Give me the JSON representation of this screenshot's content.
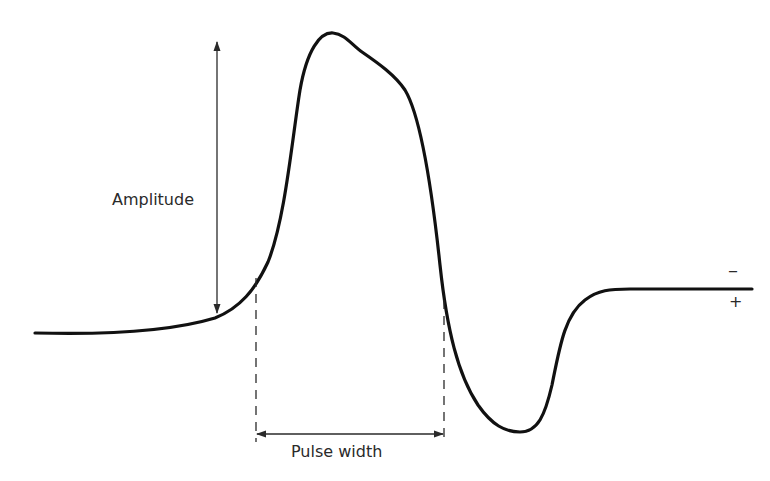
{
  "diagram": {
    "labels": {
      "amplitude": "Amplitude",
      "pulse_width": "Pulse width",
      "minus": "–",
      "plus": "+"
    },
    "colors": {
      "waveform": "#111111",
      "annotation": "#2a2a2a",
      "background": "#ffffff"
    }
  }
}
